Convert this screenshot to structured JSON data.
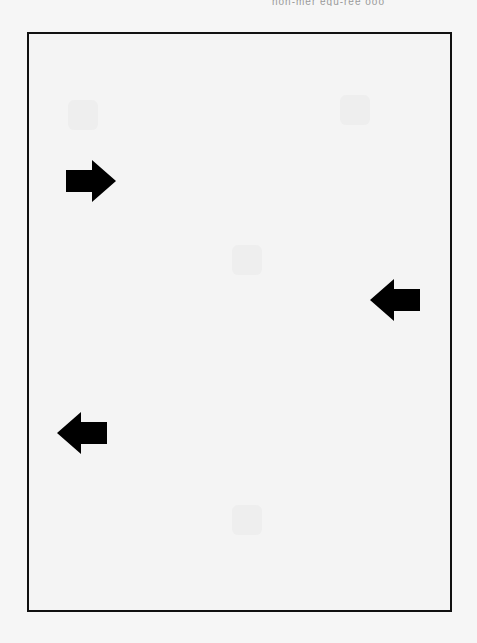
{
  "header": {
    "text": "non-mer equ-ree ooo"
  },
  "frame": {
    "border_color": "#111111",
    "background": "#f4f4f4"
  },
  "arrows": [
    {
      "direction": "right",
      "x": 67,
      "y": 161,
      "color": "#000000"
    },
    {
      "direction": "left",
      "x": 371,
      "y": 280,
      "color": "#000000"
    },
    {
      "direction": "left",
      "x": 58,
      "y": 413,
      "color": "#000000"
    }
  ]
}
